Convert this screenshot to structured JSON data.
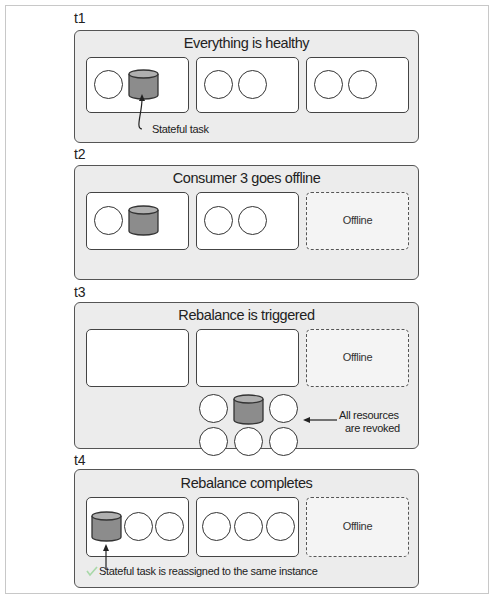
{
  "steps": [
    {
      "label": "t1",
      "title": "Everything is healthy",
      "consumers": [
        {
          "state": "online",
          "items": [
            "task",
            "stateful-task"
          ]
        },
        {
          "state": "online",
          "items": [
            "task",
            "task"
          ]
        },
        {
          "state": "online",
          "items": [
            "task",
            "task"
          ]
        }
      ],
      "annotation": "Stateful task"
    },
    {
      "label": "t2",
      "title": "Consumer 3 goes offline",
      "consumers": [
        {
          "state": "online",
          "items": [
            "task",
            "stateful-task"
          ]
        },
        {
          "state": "online",
          "items": [
            "task",
            "task"
          ]
        },
        {
          "state": "offline",
          "label": "Offline"
        }
      ]
    },
    {
      "label": "t3",
      "title": "Rebalance is triggered",
      "consumers": [
        {
          "state": "online",
          "items": []
        },
        {
          "state": "online",
          "items": []
        },
        {
          "state": "offline",
          "label": "Offline"
        }
      ],
      "revoked_pool": [
        "task",
        "stateful-task",
        "task",
        "task",
        "task",
        "task"
      ],
      "annotation_line1": "All resources",
      "annotation_line2": "are revoked"
    },
    {
      "label": "t4",
      "title": "Rebalance completes",
      "consumers": [
        {
          "state": "online",
          "items": [
            "stateful-task",
            "task",
            "task"
          ]
        },
        {
          "state": "online",
          "items": [
            "task",
            "task",
            "task"
          ]
        },
        {
          "state": "offline",
          "label": "Offline"
        }
      ],
      "annotation": "Stateful task is reassigned to the same instance",
      "annotation_icon": "check-icon"
    }
  ],
  "colors": {
    "panel_bg": "#ececec",
    "stateful_task_fill": "#8c8c8c",
    "stateful_task_top": "#b0b0b0",
    "check": "#a8d8a8"
  }
}
